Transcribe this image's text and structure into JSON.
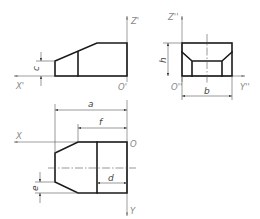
{
  "figure": {
    "views": {
      "front": {
        "axes": {
          "vertical": "Z'",
          "horizontal": "X'",
          "origin": "O'"
        },
        "dimensions": {
          "c": "c"
        }
      },
      "side": {
        "axes": {
          "vertical": "Z''",
          "horizontal": "Y''",
          "origin": "O''"
        },
        "dimensions": {
          "h": "h",
          "b": "b"
        }
      },
      "top": {
        "axes": {
          "horizontal": "X",
          "vertical": "Y",
          "origin": "O"
        },
        "dimensions": {
          "a": "a",
          "f": "f",
          "d": "d",
          "e": "e"
        }
      }
    },
    "colors": {
      "outline": "#1a1a1a",
      "thin": "#555555",
      "axis_label": "#888888"
    }
  }
}
